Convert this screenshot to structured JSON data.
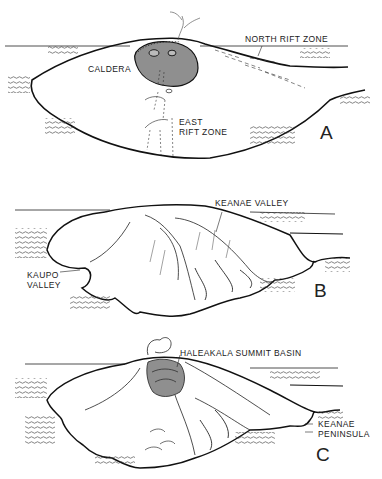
{
  "figure": {
    "panels": [
      {
        "id": "A",
        "letter": "A",
        "labels": {
          "caldera": "CALDERA",
          "north_rift_zone": "NORTH RIFT ZONE",
          "east_rift_line1": "EAST",
          "east_rift_line2": "RIFT ZONE"
        }
      },
      {
        "id": "B",
        "letter": "B",
        "labels": {
          "keanae_valley": "KEANAE VALLEY",
          "kaupo_line1": "KAUPO",
          "kaupo_line2": "VALLEY"
        }
      },
      {
        "id": "C",
        "letter": "C",
        "labels": {
          "summit_basin": "HALEAKALA SUMMIT BASIN",
          "keanae_pen_line1": "KEANAE",
          "keanae_pen_line2": "PENINSULA"
        }
      }
    ],
    "colors": {
      "ink": "#1a1a1a",
      "shade": "#8f8f8f",
      "paper": "#ffffff"
    }
  }
}
